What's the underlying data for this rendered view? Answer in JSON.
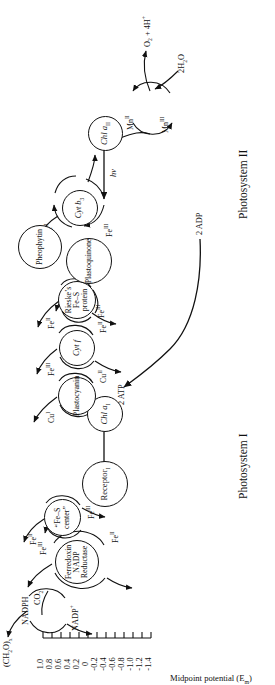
{
  "figure": {
    "axis_title": "Midpoint potential (E",
    "axis_title_sub": "m",
    "axis_title_end": ")",
    "ticks": [
      "1.0",
      "0.8",
      "0.6",
      "0.4",
      "0.2",
      "0",
      "-0.2",
      "-0.4",
      "-0.6",
      "-0.8",
      "-1.0",
      "-1.2",
      "-1.4"
    ],
    "tick_values": [
      1.0,
      0.8,
      0.6,
      0.4,
      0.2,
      0,
      -0.2,
      -0.4,
      -0.6,
      -0.8,
      -1.0,
      -1.2,
      -1.4
    ]
  },
  "sections": {
    "ps1": "Photosystem I",
    "ps2": "Photosystem II"
  },
  "nodes": {
    "receptor": "Receptor",
    "receptor_sub": "I",
    "fes_center": "“Fe–S center”",
    "ferredoxin": "Ferredoxin NADP Reductase",
    "chla1": "Chl a",
    "chla1_sub": "I",
    "plastocyanin": "Plastocyanin",
    "cytf": "Cyt f",
    "rieske": "Rieske’s Fe–S protein",
    "plastoquinone": "Plastoquinone",
    "cytb3": "Cyt b",
    "cytb3_sub": "3",
    "pheophytin": "Pheophytin",
    "chla2": "Chl a",
    "chla2_sub": "II",
    "mn_cycle": "Mn"
  },
  "redox": {
    "fe3": "Fe",
    "fe3_sup": "III",
    "fe2": "Fe",
    "fe2_sup": "II",
    "cu1": "Cu",
    "cu1_sup": "I",
    "cu2": "Cu",
    "cu2_sup": "II",
    "mn3": "Mn",
    "mn3_sup": "III",
    "mn2": "Mn",
    "mn2_sup": "II"
  },
  "molecules": {
    "nadph": "NADPH",
    "nadp_plus": "NADP",
    "nadp_sup": "+",
    "co2": "CO",
    "co2_sub": "2",
    "carbohydrate": "(CH",
    "carbohydrate_sub1": "2",
    "carbohydrate_mid": "O)",
    "carbohydrate_sub2": "x",
    "atp": "2 ATP",
    "adp": "2 ADP",
    "water": "2H",
    "water_sub": "2",
    "water_end": "O",
    "oxygen": "O",
    "oxygen_sub": "2",
    "oxygen_end": " + 4H",
    "oxygen_sup": "+"
  },
  "light": {
    "photon": "hν"
  },
  "colors": {
    "ink": "#111111",
    "paper": "#ffffff"
  }
}
